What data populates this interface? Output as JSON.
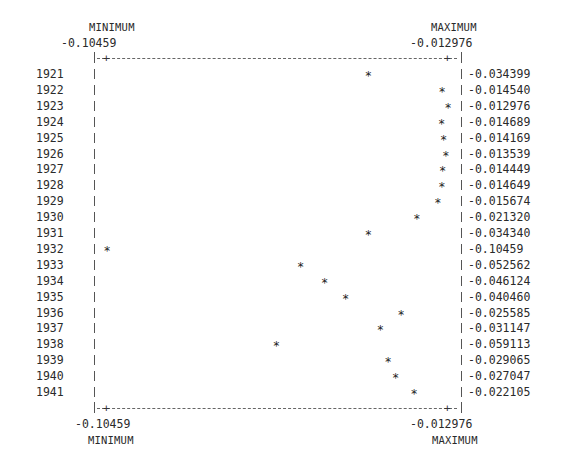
{
  "chart_data": {
    "type": "scatter",
    "title": "",
    "xlabel": "",
    "ylabel": "",
    "orientation": "horizontal line-printer dot plot",
    "top_axis": {
      "min_label": "MINIMUM",
      "min_value": "-0.10459",
      "max_label": "MAXIMUM",
      "max_value": "-0.012976"
    },
    "bottom_axis": {
      "min_label": "MINIMUM",
      "min_value": "-0.10459",
      "max_label": "MAXIMUM",
      "max_value": "-0.012976"
    },
    "xlim": [
      -0.10459,
      -0.012976
    ],
    "grid": false,
    "categories": [
      "1921",
      "1922",
      "1923",
      "1924",
      "1925",
      "1926",
      "1927",
      "1928",
      "1929",
      "1930",
      "1931",
      "1932",
      "1933",
      "1934",
      "1935",
      "1936",
      "1937",
      "1938",
      "1939",
      "1940",
      "1941"
    ],
    "value_labels": [
      "-0.034399",
      "-0.014540",
      "-0.012976",
      "-0.014689",
      "-0.014169",
      "-0.013539",
      "-0.014449",
      "-0.014649",
      "-0.015674",
      "-0.021320",
      "-0.034340",
      "-0.10459",
      "-0.052562",
      "-0.046124",
      "-0.040460",
      "-0.025585",
      "-0.031147",
      "-0.059113",
      "-0.029065",
      "-0.027047",
      "-0.022105"
    ],
    "values": [
      -0.034399,
      -0.01454,
      -0.012976,
      -0.014689,
      -0.014169,
      -0.013539,
      -0.014449,
      -0.014649,
      -0.015674,
      -0.02132,
      -0.03434,
      -0.10459,
      -0.052562,
      -0.046124,
      -0.04046,
      -0.025585,
      -0.031147,
      -0.059113,
      -0.029065,
      -0.027047,
      -0.022105
    ],
    "marker": "*"
  }
}
